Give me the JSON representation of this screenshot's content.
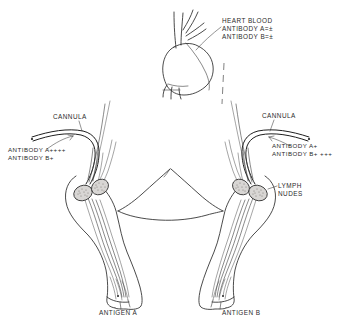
{
  "figure": {
    "domain": "anatomical-diagram",
    "title_visible": false,
    "background_color": "#ffffff",
    "ink_color": "#2b2b2b",
    "node_fill_color": "#d8d6d4",
    "style": "hand-drawn line illustration"
  },
  "labels": {
    "heart_blood": {
      "lines": [
        "HEART BLOOD",
        "ANTIBODY A=±",
        "ANTIBODY B=±"
      ],
      "text": "HEART BLOOD\nANTIBODY A=±\nANTIBODY B=±"
    },
    "cannula_left": {
      "text": "CANNULA"
    },
    "antibody_left": {
      "lines": [
        "ANTIBODY A++++",
        "ANTIBODY B+"
      ],
      "text": "ANTIBODY A++++\nANTIBODY B+"
    },
    "cannula_right": {
      "text": "CANNULA"
    },
    "antibody_right": {
      "lines": [
        "ANTIBODY A+",
        "ANTIBODY B+ +++"
      ],
      "text": "ANTIBODY A+\nANTIBODY B+ +++"
    },
    "lymph_nodes": {
      "lines": [
        "LYMPH",
        "NUDES"
      ],
      "text": "LYMPH\nNUDES"
    },
    "antigen_a": {
      "text": "ANTIGEN A"
    },
    "antigen_b": {
      "text": "ANTIGEN B"
    }
  },
  "annotations": {
    "heart": {
      "name": "heart",
      "sample_site": "HEART BLOOD",
      "antibody_a": "±",
      "antibody_b": "±"
    },
    "left_limb": {
      "name": "left limb",
      "antigen": "ANTIGEN A",
      "antibody_a": "++++",
      "antibody_b": "+",
      "has_cannula": true,
      "has_lymph_nodes": true
    },
    "right_limb": {
      "name": "right limb",
      "antigen": "ANTIGEN B",
      "antibody_a": "+",
      "antibody_b": "+ +++",
      "has_cannula": true,
      "has_lymph_nodes": true
    }
  },
  "icons": {
    "heart": "heart-icon",
    "lymph_node": "lymph-node-icon",
    "cannula": "cannula-tube-icon",
    "lymph_vessel": "lymph-vessel-icon",
    "limb": "limb-icon",
    "torso": "torso-outline-icon",
    "leader_line": "leader-line-icon",
    "dashed_connector": "dashed-connector-icon"
  }
}
